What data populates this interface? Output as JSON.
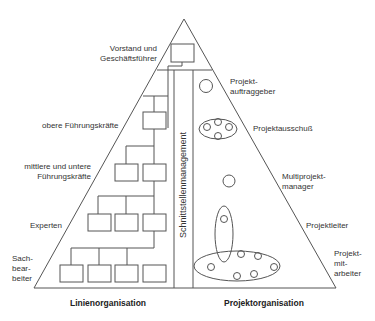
{
  "diagram": {
    "title_left": "Linienorganisation",
    "title_right": "Projektorganisation",
    "center_column": "Schnittstellenmanagement",
    "left_levels": [
      {
        "line1": "Vorstand und",
        "line2": "Geschäftsführer"
      },
      {
        "line1": "obere Führungskräfte"
      },
      {
        "line1": "mittlere und untere",
        "line2": "Führungskräfte"
      },
      {
        "line1": "Experten"
      },
      {
        "line1": "Sach-",
        "line2": "bear-",
        "line3": "beiter"
      }
    ],
    "right_levels": [
      {
        "line1": "Projekt-",
        "line2": "auftraggeber"
      },
      {
        "line1": "Projektausschuß"
      },
      {
        "line1": "Multiprojekt-",
        "line2": "manager"
      },
      {
        "line1": "Projektleiter"
      },
      {
        "line1": "Projekt-",
        "line2": "mit-",
        "line3": "arbeiter"
      }
    ],
    "colors": {
      "stroke": "#555555",
      "text": "#333333",
      "background": "#ffffff"
    }
  }
}
